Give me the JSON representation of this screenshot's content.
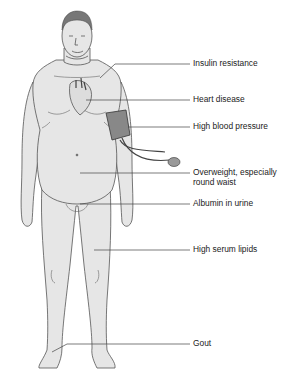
{
  "figure": {
    "type": "anatomical illustration",
    "skin_color": "#e6e6e6",
    "outline_color": "#555555",
    "leader_color": "#444444",
    "labels": [
      {
        "id": "insulin",
        "text": "Insulin resistance",
        "y": 64
      },
      {
        "id": "heart",
        "text": "Heart disease",
        "y": 100
      },
      {
        "id": "bp",
        "text": "High blood pressure",
        "y": 127
      },
      {
        "id": "waist1",
        "text": "Overweight, especially",
        "y": 172
      },
      {
        "id": "waist2",
        "text": "round waist",
        "y": 182
      },
      {
        "id": "albumin",
        "text": "Albumin in urine",
        "y": 204
      },
      {
        "id": "lipids",
        "text": "High serum lipids",
        "y": 250
      },
      {
        "id": "gout",
        "text": "Gout",
        "y": 344
      }
    ]
  }
}
